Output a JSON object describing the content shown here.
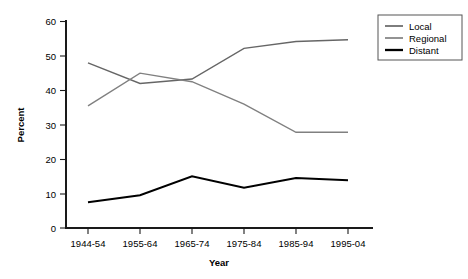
{
  "chart_data": {
    "type": "line",
    "title": "",
    "xlabel": "Year",
    "ylabel": "Percent",
    "categories": [
      "1944-54",
      "1955-64",
      "1965-74",
      "1975-84",
      "1985-94",
      "1995-04"
    ],
    "series": [
      {
        "name": "Local",
        "values": [
          48.0,
          42.0,
          43.3,
          52.2,
          54.2,
          54.7
        ],
        "color": "#666666",
        "line_width": 1.4
      },
      {
        "name": "Regional",
        "values": [
          35.5,
          45.0,
          42.5,
          36.0,
          27.8,
          27.8
        ],
        "color": "#808080",
        "line_width": 1.4
      },
      {
        "name": "Distant",
        "values": [
          7.5,
          9.5,
          15.0,
          11.7,
          14.5,
          13.9
        ],
        "color": "#000000",
        "line_width": 2.0
      }
    ],
    "ylim": [
      0,
      60
    ],
    "yticks": [
      0,
      10,
      20,
      30,
      40,
      50,
      60
    ],
    "ytick_labels": [
      "0",
      "10",
      "20",
      "30",
      "40",
      "50",
      "60"
    ],
    "grid": false,
    "legend_position": "upper-right-outside",
    "legend_entries": [
      "Local",
      "Regional",
      "Distant"
    ]
  },
  "axes": {
    "y_title": "Percent",
    "x_title": "Year"
  },
  "legend": {
    "items": [
      {
        "label": "Local"
      },
      {
        "label": "Regional"
      },
      {
        "label": "Distant"
      }
    ]
  }
}
